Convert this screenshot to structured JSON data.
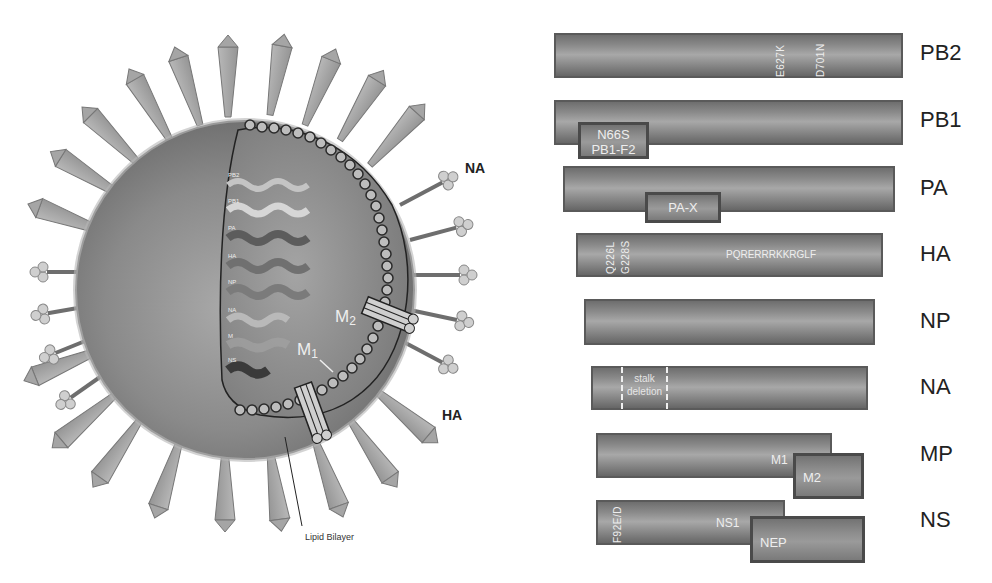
{
  "virion": {
    "labels": {
      "na": "NA",
      "ha": "HA",
      "m1": "M",
      "m1_sub": "1",
      "m2": "M",
      "m2_sub": "2",
      "lipid_bilayer": "Lipid Bilayer"
    },
    "rnp_labels": [
      "PB2",
      "PB1",
      "PA",
      "HA",
      "NP",
      "NA",
      "M",
      "NS"
    ]
  },
  "segments": [
    {
      "name": "PB2",
      "annotations": [
        "E627K",
        "D701N"
      ]
    },
    {
      "name": "PB1",
      "box": {
        "line1": "N66S",
        "line2": "PB1-F2"
      }
    },
    {
      "name": "PA",
      "box": {
        "line1": "PA-X"
      }
    },
    {
      "name": "HA",
      "annotations": [
        "Q226L",
        "G228S"
      ],
      "inline": "PQRERRRKKRGLF"
    },
    {
      "name": "NP"
    },
    {
      "name": "NA",
      "region": {
        "line1": "stalk",
        "line2": "deletion"
      }
    },
    {
      "name": "MP",
      "inline": "M1",
      "box": {
        "line1": "M2"
      }
    },
    {
      "name": "NS",
      "annotations": [
        "F92E/D"
      ],
      "inline": "NS1",
      "box": {
        "line1": "NEP"
      }
    }
  ],
  "colors": {
    "segment_fill": "#8c8c8c",
    "segment_border": "#5a5a5a",
    "box_border": "#4a4a4a",
    "label_text": "#222222",
    "inner_text": "#eeeeee"
  }
}
